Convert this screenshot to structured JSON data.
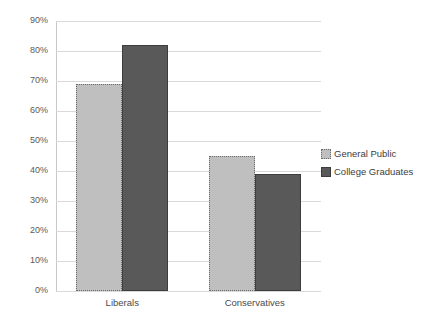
{
  "chart_data": {
    "type": "bar",
    "title": "",
    "subtitle": "",
    "xlabel": "",
    "ylabel": "",
    "ylim": [
      0,
      90
    ],
    "grid": true,
    "legend_position": "right",
    "categories": [
      "Liberals",
      "Conservatives"
    ],
    "ytick_labels": [
      "90%",
      "80%",
      "70%",
      "60%",
      "50%",
      "40%",
      "30%",
      "20%",
      "10%",
      "0%"
    ],
    "ytick_values": [
      90,
      80,
      70,
      60,
      50,
      40,
      30,
      20,
      10,
      0
    ],
    "series": [
      {
        "name": "General Public",
        "color": "#bfbfbf",
        "border_color": "#6b6b6b",
        "border_style": "dotted",
        "values": [
          69,
          45
        ]
      },
      {
        "name": "College Graduates",
        "color": "#595959",
        "border_color": "#3d3d3d",
        "border_style": "solid",
        "values": [
          82,
          39
        ]
      }
    ]
  },
  "legend": {
    "items": [
      {
        "label": "General Public"
      },
      {
        "label": "College Graduates"
      }
    ]
  },
  "colors": {
    "gridline": "#d9d9d9",
    "axis": "#c9c9c9",
    "tick_text": "#5a5a5a",
    "label_text": "#4a4a4a",
    "background": "#ffffff"
  }
}
